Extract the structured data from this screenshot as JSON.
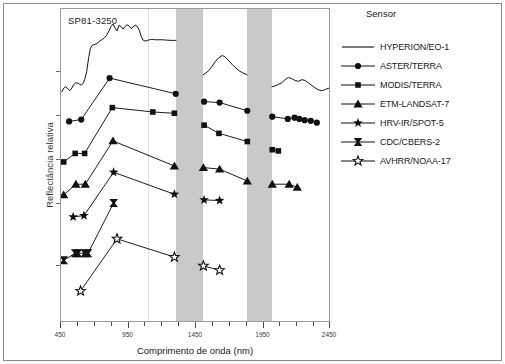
{
  "figure": {
    "sample_label": "SP81-3250"
  },
  "legend": {
    "title": "Sensor",
    "items": [
      {
        "label": "HYPERION/EO-1",
        "marker": "none",
        "icon": "line-swatch-icon"
      },
      {
        "label": "ASTER/TERRA",
        "marker": "circle",
        "icon": "circle-marker-icon"
      },
      {
        "label": "MODIS/TERRA",
        "marker": "square",
        "icon": "square-marker-icon"
      },
      {
        "label": "ETM-LANDSAT-7",
        "marker": "triangle",
        "icon": "triangle-marker-icon"
      },
      {
        "label": "HRV-IR/SPOT-5",
        "marker": "star",
        "icon": "star-marker-icon"
      },
      {
        "label": "CDC/CBERS-2",
        "marker": "bowtie",
        "icon": "bowtie-marker-icon"
      },
      {
        "label": "AVHRR/NOAA-17",
        "marker": "openstar",
        "icon": "open-star-marker-icon"
      }
    ]
  },
  "chart_data": {
    "type": "line",
    "title": "SP81-3250",
    "xlabel": "Comprimento de onda (nm)",
    "ylabel": "Reflectância relativa",
    "xlim": [
      450,
      2450
    ],
    "ylim": [
      0,
      1
    ],
    "grid": false,
    "legend_position": "right",
    "x_ticks_major": [
      450,
      950,
      1450,
      1950,
      2450
    ],
    "x_tick_labels": [
      "450",
      "950",
      "1450",
      "1950",
      "2450"
    ],
    "x_ticks_minor": [
      575,
      700,
      825,
      1075,
      1200,
      1325,
      1575,
      1700,
      1825,
      2075,
      2200,
      2325
    ],
    "y_ticks": [
      0.18,
      0.38,
      0.52,
      0.66,
      0.8
    ],
    "annotations": [
      {
        "text": "SP81-3250",
        "x": 500,
        "y": 0.96
      }
    ],
    "shaded_bands": [
      {
        "label": "water-absorption-band-1",
        "x0": 1300,
        "x1": 1500,
        "color": "#c9c9c9"
      },
      {
        "label": "water-absorption-band-2",
        "x0": 1830,
        "x1": 2010,
        "color": "#c9c9c9"
      }
    ],
    "series": [
      {
        "name": "HYPERION/EO-1",
        "marker": "none",
        "segments": [
          {
            "x": [
              455,
              470,
              485,
              500,
              515,
              530,
              545,
              560,
              575,
              588,
              600,
              612,
              625,
              640,
              655,
              668,
              680,
              692,
              705,
              718,
              730,
              745,
              760,
              775,
              790,
              805,
              820,
              835,
              850,
              865,
              880,
              895,
              910,
              925,
              940,
              955,
              970,
              985,
              1000,
              1015,
              1030,
              1045,
              1060,
              1075,
              1090,
              1105,
              1120,
              1135,
              1150,
              1175,
              1200,
              1230,
              1260,
              1290,
              1305
            ],
            "y": [
              0.735,
              0.748,
              0.752,
              0.746,
              0.74,
              0.748,
              0.76,
              0.765,
              0.764,
              0.76,
              0.758,
              0.762,
              0.775,
              0.8,
              0.845,
              0.875,
              0.884,
              0.886,
              0.888,
              0.89,
              0.896,
              0.9,
              0.904,
              0.91,
              0.918,
              0.93,
              0.944,
              0.952,
              0.94,
              0.93,
              0.948,
              0.944,
              0.936,
              0.944,
              0.95,
              0.946,
              0.938,
              0.944,
              0.948,
              0.945,
              0.932,
              0.912,
              0.9,
              0.898,
              0.9,
              0.902,
              0.903,
              0.903,
              0.902,
              0.902,
              0.902,
              0.901,
              0.9,
              0.9,
              0.9
            ]
          },
          {
            "x": [
              1500,
              1520,
              1545,
              1570,
              1595,
              1620,
              1645,
              1670,
              1695,
              1720,
              1745,
              1770,
              1795,
              1820,
              1830
            ],
            "y": [
              0.79,
              0.795,
              0.804,
              0.818,
              0.834,
              0.845,
              0.852,
              0.846,
              0.834,
              0.822,
              0.812,
              0.803,
              0.797,
              0.792,
              0.79
            ]
          },
          {
            "x": [
              2010,
              2035,
              2060,
              2085,
              2110,
              2135,
              2160,
              2185,
              2210,
              2235,
              2260,
              2285,
              2310,
              2335,
              2360,
              2385,
              2410,
              2435
            ],
            "y": [
              0.752,
              0.755,
              0.76,
              0.765,
              0.775,
              0.782,
              0.778,
              0.772,
              0.77,
              0.775,
              0.772,
              0.764,
              0.756,
              0.748,
              0.742,
              0.74,
              0.744,
              0.748
            ]
          }
        ]
      },
      {
        "name": "ASTER/TERRA",
        "marker": "circle",
        "segments": [
          {
            "x": [
              510,
              600,
              810,
              1300
            ],
            "y": [
              0.642,
              0.648,
              0.78,
              0.73
            ]
          },
          {
            "x": [
              1510,
              1625,
              1830
            ],
            "y": [
              0.705,
              0.702,
              0.676
            ]
          },
          {
            "x": [
              2015,
              2130,
              2180,
              2215,
              2255,
              2300,
              2345
            ],
            "y": [
              0.657,
              0.65,
              0.654,
              0.65,
              0.646,
              0.644,
              0.638
            ]
          }
        ]
      },
      {
        "name": "MODIS/TERRA",
        "marker": "square",
        "segments": [
          {
            "x": [
              470,
              555,
              625,
              830,
              1130,
              1290
            ],
            "y": [
              0.513,
              0.54,
              0.54,
              0.686,
              0.672,
              0.668
            ]
          },
          {
            "x": [
              1510,
              1620,
              1830
            ],
            "y": [
              0.63,
              0.604,
              0.578
            ]
          },
          {
            "x": [
              2015,
              2060
            ],
            "y": [
              0.552,
              0.548
            ]
          }
        ]
      },
      {
        "name": "ETM-LANDSAT-7",
        "marker": "triangle",
        "segments": [
          {
            "x": [
              470,
              560,
              630,
              835,
              1290
            ],
            "y": [
              0.408,
              0.442,
              0.442,
              0.58,
              0.5
            ]
          },
          {
            "x": [
              1505,
              1625,
              1830
            ],
            "y": [
              0.495,
              0.49,
              0.452
            ]
          },
          {
            "x": [
              2015,
              2140,
              2200
            ],
            "y": [
              0.442,
              0.442,
              0.432
            ]
          }
        ]
      },
      {
        "name": "HRV-IR/SPOT-5",
        "marker": "star",
        "segments": [
          {
            "x": [
              540,
              620,
              840,
              1290
            ],
            "y": [
              0.338,
              0.342,
              0.48,
              0.41
            ]
          },
          {
            "x": [
              1510,
              1625
            ],
            "y": [
              0.392,
              0.39
            ]
          }
        ]
      },
      {
        "name": "CDC/CBERS-2",
        "marker": "bowtie",
        "segments": [
          {
            "x": [
              470,
              555,
              575,
              625,
              650,
              840
            ],
            "y": [
              0.2,
              0.222,
              0.222,
              0.222,
              0.222,
              0.382
            ]
          }
        ]
      },
      {
        "name": "AVHRR/NOAA-17",
        "marker": "openstar",
        "segments": [
          {
            "x": [
              595,
              865,
              1290
            ],
            "y": [
              0.102,
              0.268,
              0.21
            ]
          },
          {
            "x": [
              1505,
              1625
            ],
            "y": [
              0.182,
              0.168
            ]
          }
        ]
      }
    ]
  }
}
